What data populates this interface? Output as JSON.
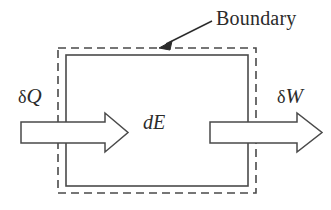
{
  "figure": {
    "background_color": "#ffffff",
    "line_color": "#4a4a4a",
    "text_color": "#2b2b2b"
  },
  "labels": {
    "boundary": "Boundary",
    "heat_in_delta": "δ",
    "heat_in_symbol": "Q",
    "work_out_delta": "δ",
    "work_out_symbol": "W",
    "energy_change_d": "d",
    "energy_change_symbol": "E"
  },
  "diagram_data": {
    "type": "schematic",
    "elements": [
      {
        "name": "system-boundary",
        "shape": "dashed-rectangle",
        "x": 58,
        "y": 48,
        "width": 198,
        "height": 145,
        "stroke": "#4a4a4a",
        "dash": "8 5"
      },
      {
        "name": "system-wall",
        "shape": "solid-rectangle",
        "x": 66,
        "y": 55,
        "width": 182,
        "height": 131,
        "stroke": "#4a4a4a",
        "fill": "none"
      },
      {
        "name": "heat-input-arrow",
        "shape": "block-arrow",
        "direction": "right",
        "tail_x": 21,
        "tip_x": 128,
        "shaft_top": 122,
        "shaft_bottom": 143,
        "head_top": 113,
        "head_bottom": 152,
        "head_base_x": 105,
        "fill": "#ffffff",
        "stroke": "#4a4a4a"
      },
      {
        "name": "work-output-arrow",
        "shape": "block-arrow",
        "direction": "right",
        "tail_x": 210,
        "tip_x": 322,
        "shaft_top": 122,
        "shaft_bottom": 143,
        "head_top": 113,
        "head_bottom": 152,
        "head_base_x": 297,
        "fill": "#ffffff",
        "stroke": "#4a4a4a"
      },
      {
        "name": "boundary-leader-line",
        "shape": "arrow-line",
        "from_x": 212,
        "from_y": 21,
        "to_x": 161,
        "to_y": 47,
        "stroke": "#2b2b2b"
      }
    ]
  }
}
